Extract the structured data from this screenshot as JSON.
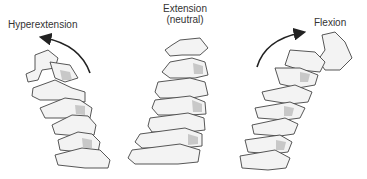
{
  "figure": {
    "panels": [
      {
        "id": "hyperextension",
        "label": "Hyperextension",
        "arrow_direction": "counterclockwise-backward"
      },
      {
        "id": "extension",
        "label_line1": "Extension",
        "label_line2": "(neutral)"
      },
      {
        "id": "flexion",
        "label": "Flexion",
        "arrow_direction": "clockwise-forward"
      }
    ]
  }
}
